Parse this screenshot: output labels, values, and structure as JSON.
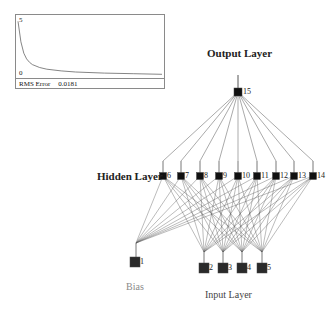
{
  "chart": {
    "y_max_label": "5",
    "y_min_label": "0",
    "footer_label": "RMS Error",
    "footer_value": "0.0181"
  },
  "chart_data": {
    "type": "line",
    "title": "",
    "xlabel": "",
    "ylabel": "RMS Error",
    "ylim": [
      0,
      5
    ],
    "series": [
      {
        "name": "RMS Error",
        "x": [
          0,
          2,
          4,
          6,
          8,
          10,
          15,
          20,
          30,
          40,
          60,
          80,
          100
        ],
        "values": [
          4.8,
          3.0,
          2.0,
          1.5,
          1.2,
          1.0,
          0.75,
          0.6,
          0.45,
          0.35,
          0.25,
          0.2,
          0.15
        ]
      }
    ],
    "final_value": 0.0181,
    "grid": false,
    "legend": "none"
  },
  "labels": {
    "output_layer": "Output Layer",
    "hidden_layer": "Hidden Layer",
    "input_layer": "Input Layer",
    "bias": "Bias"
  },
  "nodes": {
    "output": [
      {
        "id": "15",
        "x": 238,
        "y": 92
      }
    ],
    "hidden": [
      {
        "id": "6",
        "x": 163,
        "y": 176
      },
      {
        "id": "7",
        "x": 181,
        "y": 176
      },
      {
        "id": "8",
        "x": 200,
        "y": 176
      },
      {
        "id": "9",
        "x": 219,
        "y": 176
      },
      {
        "id": "10",
        "x": 238,
        "y": 176
      },
      {
        "id": "11",
        "x": 257,
        "y": 176
      },
      {
        "id": "12",
        "x": 276,
        "y": 176
      },
      {
        "id": "13",
        "x": 294,
        "y": 176
      },
      {
        "id": "14",
        "x": 313,
        "y": 176
      }
    ],
    "input": [
      {
        "id": "2",
        "x": 204,
        "y": 268
      },
      {
        "id": "3",
        "x": 223,
        "y": 268
      },
      {
        "id": "4",
        "x": 242,
        "y": 268
      },
      {
        "id": "5",
        "x": 262,
        "y": 268
      }
    ],
    "bias": [
      {
        "id": "1",
        "x": 135,
        "y": 262
      }
    ]
  },
  "colors": {
    "node_fill": "#111111",
    "input_node_fill": "#2a2a2a",
    "edge": "#555555",
    "chart_border": "#8a8a8a"
  }
}
